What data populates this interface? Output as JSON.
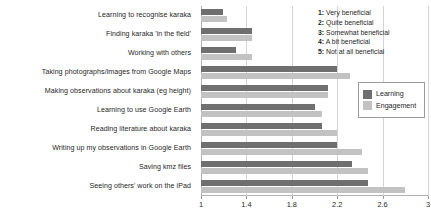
{
  "chart_data": {
    "type": "bar",
    "orientation": "horizontal",
    "title": "",
    "xlabel": "",
    "ylabel": "",
    "xlim": [
      1,
      3
    ],
    "xticks": [
      "1",
      "1.4",
      "1.8",
      "2.2",
      "2.6",
      "3"
    ],
    "xtick_values": [
      1,
      1.4,
      1.8,
      2.2,
      2.6,
      3
    ],
    "grid": true,
    "legend_position": "right",
    "categories": [
      "Learning to recognise karaka",
      "Finding karaka 'in the field'",
      "Working with others",
      "Taking photographs/images from Google Maps",
      "Making observations about karaka (eg height)",
      "Learning to use Google Earth",
      "Reading literature about karaka",
      "Writing up my observations in Google Earth",
      "Saving kmz files",
      "Seeing others' work on the iPad"
    ],
    "series": [
      {
        "name": "Learning",
        "color": "#6f6f6f",
        "values": [
          1.19,
          1.45,
          1.31,
          2.2,
          2.12,
          2.0,
          2.07,
          2.2,
          2.33,
          2.47
        ]
      },
      {
        "name": "Engagement",
        "color": "#c2c2c2",
        "values": [
          1.23,
          1.45,
          1.45,
          2.31,
          2.12,
          2.07,
          2.2,
          2.42,
          2.47,
          2.8
        ]
      }
    ]
  },
  "scale_key": {
    "items": [
      {
        "num": "1:",
        "text": "Very beneficial"
      },
      {
        "num": "2:",
        "text": "Quite beneficial"
      },
      {
        "num": "3:",
        "text": "Somewhat beneficial"
      },
      {
        "num": "4:",
        "text": "A bit beneficial"
      },
      {
        "num": "5:",
        "text": "Not at all beneficial"
      }
    ]
  },
  "legend": {
    "entries": [
      {
        "label": "Learning"
      },
      {
        "label": "Engagement"
      }
    ]
  }
}
